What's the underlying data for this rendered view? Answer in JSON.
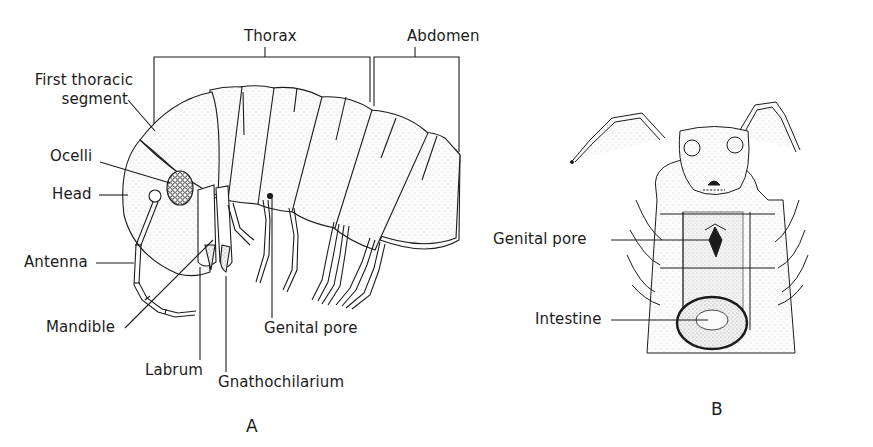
{
  "figure": {
    "panel_a": {
      "panel_label": "A",
      "view": "lateral",
      "labels": {
        "thorax": "Thorax",
        "abdomen": "Abdomen",
        "first_thoracic_segment_line1": "First thoracic",
        "first_thoracic_segment_line2": "segment",
        "ocelli": "Ocelli",
        "head": "Head",
        "antenna": "Antenna",
        "mandible": "Mandible",
        "labrum": "Labrum",
        "gnathochilarium": "Gnathochilarium",
        "genital_pore": "Genital pore"
      }
    },
    "panel_b": {
      "panel_label": "B",
      "view": "ventral",
      "labels": {
        "genital_pore": "Genital pore",
        "intestine": "Intestine"
      }
    },
    "colors": {
      "ink": "#1c1c1c",
      "stipple": "#d9d9d9",
      "background": "#ffffff"
    }
  }
}
